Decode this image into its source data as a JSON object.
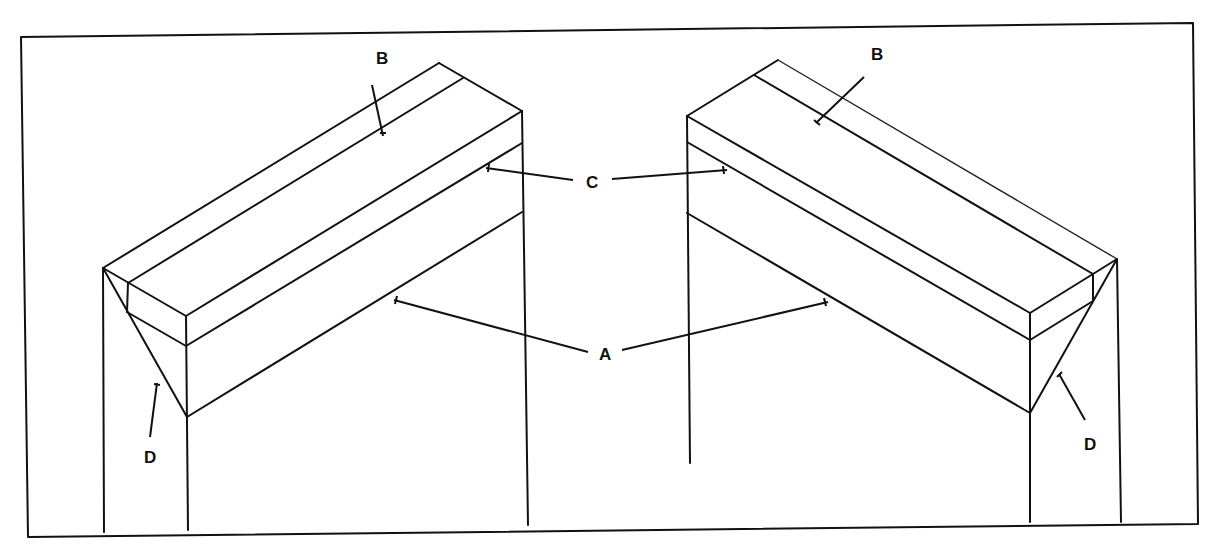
{
  "figure": {
    "type": "technical line drawing",
    "colors": {
      "background": "#ffffff",
      "line": "#111111"
    }
  },
  "labels": {
    "A": "A",
    "B": "B",
    "C": "C",
    "D": "D"
  },
  "callouts": [
    {
      "label": "B",
      "target": "left-beam-top-strip",
      "side": "left"
    },
    {
      "label": "B",
      "target": "right-beam-top-strip",
      "side": "right"
    },
    {
      "label": "C",
      "target": "beam-upper-band",
      "side": "both"
    },
    {
      "label": "A",
      "target": "beam-lower-face",
      "side": "both"
    },
    {
      "label": "D",
      "target": "left-end-triangle",
      "side": "left"
    },
    {
      "label": "D",
      "target": "right-end-triangle",
      "side": "right"
    }
  ]
}
